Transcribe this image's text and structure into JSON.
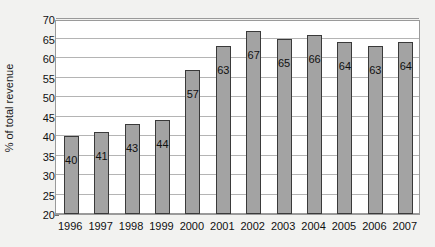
{
  "chart_data": {
    "type": "bar",
    "title": "",
    "xlabel": "",
    "ylabel": "% of total revenue",
    "categories": [
      "1996",
      "1997",
      "1998",
      "1999",
      "2000",
      "2001",
      "2002",
      "2003",
      "2004",
      "2005",
      "2006",
      "2007"
    ],
    "values": [
      40,
      41,
      43,
      44,
      57,
      63,
      67,
      65,
      66,
      64,
      63,
      64
    ],
    "data_labels": [
      "40",
      "41",
      "43",
      "44",
      "57",
      "63",
      "67",
      "65",
      "66",
      "64",
      "63",
      "64"
    ],
    "ylim": [
      20,
      70
    ],
    "ytick_step": 5,
    "yticks": [
      20,
      25,
      30,
      35,
      40,
      45,
      50,
      55,
      60,
      65,
      70
    ],
    "ytick_labels": [
      "20",
      "25",
      "30",
      "35",
      "40",
      "45",
      "50",
      "55",
      "60",
      "65",
      "70"
    ],
    "grid": true,
    "legend": false,
    "legend_position": "none",
    "bar_color": "#a3a3a3",
    "bar_border_color": "#3a3a3a",
    "plot_background": "#ffffff",
    "figure_background": "#f2f2f0",
    "gridline_color": "#b4b4b4",
    "axis_color": "#9a9a9a",
    "text_color": "#101010"
  }
}
